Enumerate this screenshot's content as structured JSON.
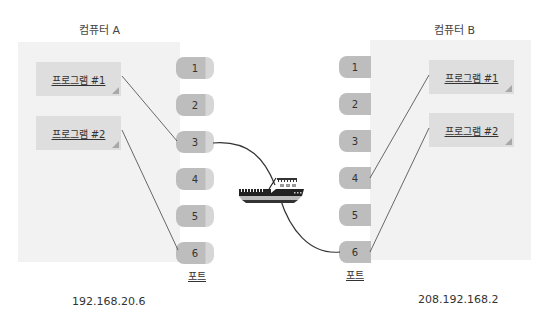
{
  "computer_a": {
    "title": "컴퓨터 A",
    "ip": "192.168.20.6",
    "programs": [
      {
        "label": "프로그램 #1"
      },
      {
        "label": "프로그램 #2"
      }
    ],
    "ports_label": "포트",
    "ports": [
      "1",
      "2",
      "3",
      "4",
      "5",
      "6"
    ]
  },
  "computer_b": {
    "title": "컴퓨터 B",
    "ip": "208.192.168.2",
    "programs": [
      {
        "label": "프로그램 #1"
      },
      {
        "label": "프로그램 #2"
      }
    ],
    "ports_label": "포트",
    "ports": [
      "1",
      "2",
      "3",
      "4",
      "5",
      "6"
    ]
  },
  "connections": [
    {
      "from": "A.프로그램 #1",
      "to": "A.port 3"
    },
    {
      "from": "A.프로그램 #2",
      "to": "A.port 6"
    },
    {
      "from": "A.port 3",
      "to": "B.port 6",
      "via": "ship-icon"
    },
    {
      "from": "B.port 4",
      "to": "B.프로그램 #1"
    },
    {
      "from": "B.port 6",
      "to": "B.프로그램 #2"
    }
  ],
  "icons": {
    "transport": "ship-icon"
  },
  "colors": {
    "panel": "#f2f2f2",
    "program_box": "#dedede",
    "port": "#bdbdbd",
    "line": "#333333"
  }
}
